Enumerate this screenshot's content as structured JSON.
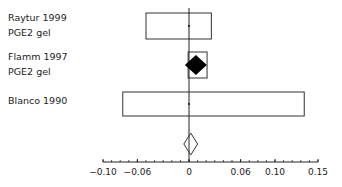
{
  "chart_data": {
    "type": "forest",
    "title": "",
    "xlabel": "",
    "ylabel": "",
    "xlim": [
      -0.1,
      0.15
    ],
    "grid": false,
    "reference_line": 0,
    "x_ticks": [
      -0.1,
      -0.06,
      0,
      0.06,
      0.1,
      0.15
    ],
    "x_tick_labels": [
      "−0.10",
      "−0.06",
      "0",
      "0.06",
      "0.10",
      "0.15"
    ],
    "minor_tick_step": 0.01,
    "studies": [
      {
        "label_lines": [
          "Raytur 1999",
          "PGE2 gel"
        ],
        "estimate": 0.0,
        "ci": [
          -0.05,
          0.026
        ],
        "marker": "point"
      },
      {
        "label_lines": [
          "Flamm 1997",
          "PGE2 gel"
        ],
        "estimate": 0.008,
        "ci": [
          -0.001,
          0.021
        ],
        "marker": "filled-diamond"
      },
      {
        "label_lines": [
          "Blanco 1990"
        ],
        "estimate": 0.0,
        "ci": [
          -0.077,
          0.134
        ],
        "marker": "point"
      }
    ],
    "summary": {
      "estimate": 0.002,
      "ci": [
        -0.006,
        0.01
      ],
      "marker": "open-diamond"
    }
  }
}
